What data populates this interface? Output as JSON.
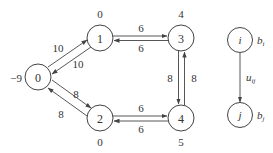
{
  "diagram": {
    "type": "network-flow-graph",
    "nodes": [
      {
        "id": "0",
        "label": "0",
        "supply": "-9",
        "cx": 38,
        "cy": 77
      },
      {
        "id": "1",
        "label": "1",
        "supply": "0",
        "cx": 100,
        "cy": 38
      },
      {
        "id": "2",
        "label": "2",
        "supply": "0",
        "cx": 100,
        "cy": 118
      },
      {
        "id": "3",
        "label": "3",
        "supply": "4",
        "cx": 181,
        "cy": 38
      },
      {
        "id": "4",
        "label": "4",
        "supply": "5",
        "cx": 181,
        "cy": 118
      }
    ],
    "edges": [
      {
        "from": "0",
        "to": "1",
        "capacity": "10"
      },
      {
        "from": "1",
        "to": "0",
        "capacity": "10"
      },
      {
        "from": "0",
        "to": "2",
        "capacity": "8"
      },
      {
        "from": "2",
        "to": "0",
        "capacity": "8"
      },
      {
        "from": "1",
        "to": "3",
        "capacity": "6"
      },
      {
        "from": "3",
        "to": "1",
        "capacity": "6"
      },
      {
        "from": "2",
        "to": "4",
        "capacity": "6"
      },
      {
        "from": "4",
        "to": "2",
        "capacity": "6"
      },
      {
        "from": "3",
        "to": "4",
        "capacity": "8"
      },
      {
        "from": "4",
        "to": "3",
        "capacity": "8"
      }
    ],
    "labels": {
      "n0": "0",
      "n1": "1",
      "n2": "2",
      "n3": "3",
      "n4": "4",
      "s0": "−9",
      "s1": "0",
      "s2": "0",
      "s3": "4",
      "s4": "5",
      "e01": "10",
      "e10": "10",
      "e02": "8",
      "e20": "8",
      "e13": "6",
      "e31": "6",
      "e24": "6",
      "e42": "6",
      "e34": "8",
      "e43": "8"
    },
    "legend": {
      "node_i": "i",
      "node_j": "j",
      "b_i": "b",
      "b_i_sub": "i",
      "b_j": "b",
      "b_j_sub": "j",
      "u_ij": "u",
      "u_ij_sub": "ij"
    }
  }
}
